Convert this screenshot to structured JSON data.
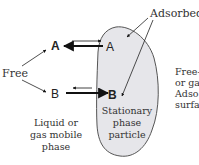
{
  "diagram": {
    "labels": {
      "adsorbed": "Adsorbed",
      "free": "Free",
      "species_a_free": "A",
      "species_a_adsorbed": "A",
      "species_b_free": "B",
      "species_b_adsorbed": "B",
      "mobile_phase": [
        "Liquid or",
        "gas mobile",
        "phase"
      ],
      "stationary_phase": [
        "Stationary",
        "phase",
        "particle"
      ],
      "right_caption": [
        "Free-",
        "or ga",
        "Adso",
        "surfa"
      ]
    },
    "colors": {
      "particle_fill": "#e6e6ea",
      "particle_stroke": "#555555",
      "arrow": "#111111",
      "text": "#333333"
    },
    "equilibria": [
      {
        "species": "A",
        "dominant_direction": "to mobile phase (free)"
      },
      {
        "species": "B",
        "dominant_direction": "to stationary phase (adsorbed)"
      }
    ]
  }
}
